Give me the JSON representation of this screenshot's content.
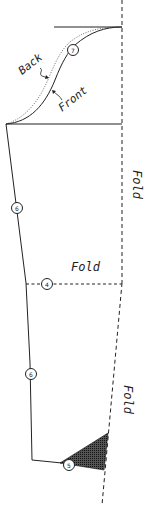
{
  "diagram": {
    "type": "sewing-pattern-piece",
    "labels": {
      "back": "Back",
      "front": "Front",
      "fold_right_upper": "Fold",
      "fold_middle": "Fold",
      "fold_right_lower": "Fold"
    },
    "markers": [
      {
        "id": "marker-7",
        "number": "7"
      },
      {
        "id": "marker-6-upper",
        "number": "6"
      },
      {
        "id": "marker-4",
        "number": "4"
      },
      {
        "id": "marker-6-lower",
        "number": "6"
      },
      {
        "id": "marker-5",
        "number": "5"
      }
    ],
    "colors": {
      "line": "#222222",
      "shade": "#333333",
      "background": "#ffffff"
    }
  }
}
